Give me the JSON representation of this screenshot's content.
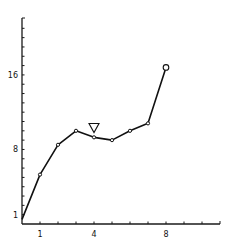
{
  "chart_data": {
    "type": "line",
    "title": "",
    "xlabel": "",
    "ylabel": "",
    "xlim": [
      0,
      11
    ],
    "ylim": [
      0,
      22
    ],
    "x_ticks": [
      0,
      1,
      2,
      3,
      4,
      5,
      6,
      7,
      8,
      9,
      10,
      11
    ],
    "x_tick_labels": [
      {
        "value": 1,
        "label": "1"
      },
      {
        "value": 4,
        "label": "4"
      },
      {
        "value": 8,
        "label": "8"
      }
    ],
    "y_ticks": [
      1,
      2,
      3,
      4,
      5,
      6,
      7,
      8,
      9,
      10,
      11,
      12,
      13,
      14,
      15,
      16,
      17,
      18,
      19,
      20,
      21,
      22
    ],
    "y_tick_labels": [
      {
        "value": 1,
        "label": "1"
      },
      {
        "value": 8,
        "label": "8"
      },
      {
        "value": 16,
        "label": "16"
      }
    ],
    "grid": false,
    "legend": null,
    "series": [
      {
        "name": "series-1",
        "x": [
          0,
          1,
          2,
          3,
          4,
          5,
          6,
          7,
          8
        ],
        "y": [
          0.5,
          5.3,
          8.5,
          10.0,
          9.3,
          9.0,
          10.0,
          10.8,
          16.8
        ],
        "marker": "open-circle",
        "last_point_marker": "large-open-circle"
      }
    ],
    "annotations": [
      {
        "type": "down-triangle",
        "x": 4,
        "y": 10.3,
        "text": ""
      }
    ]
  }
}
